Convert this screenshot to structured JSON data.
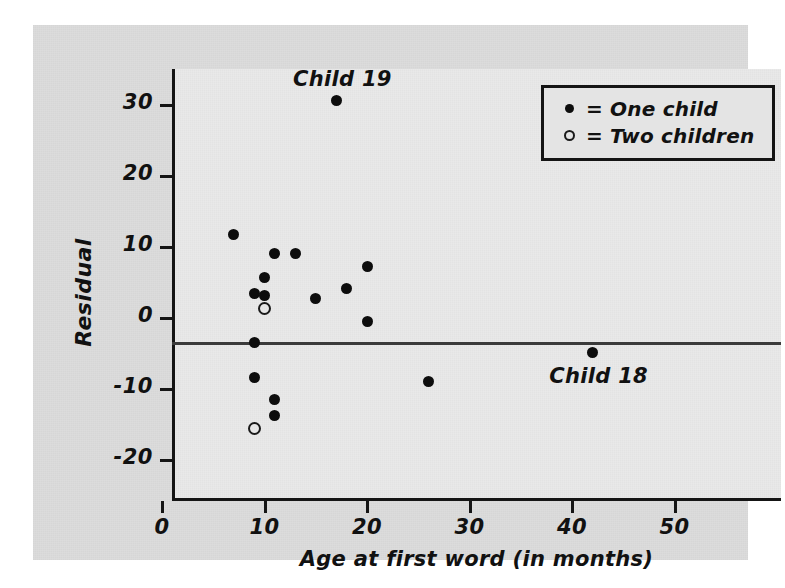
{
  "chart_data": {
    "type": "scatter",
    "title": "",
    "xlabel": "Age at first word (in months)",
    "ylabel": "Residual",
    "xlim": [
      -2,
      57
    ],
    "ylim": [
      -23,
      37
    ],
    "xticks": [
      0,
      10,
      20,
      30,
      40,
      50
    ],
    "yticks": [
      30,
      20,
      10,
      0,
      -10,
      -20
    ],
    "xtick_labels": [
      "0",
      "10",
      "20",
      "30",
      "40",
      "50"
    ],
    "ytick_labels": [
      "30",
      "20",
      "10",
      "0",
      "-10",
      "-20"
    ],
    "grid": false,
    "reference_lines": [
      {
        "axis": "y",
        "value": 0
      }
    ],
    "legend_position": "top-right",
    "series": [
      {
        "name": "One child",
        "marker": "filled-circle",
        "color": "#0d0d0d",
        "points": [
          {
            "x": 7,
            "y": 11.8
          },
          {
            "x": 9,
            "y": 3.5
          },
          {
            "x": 10,
            "y": 5.7
          },
          {
            "x": 10,
            "y": 3.2
          },
          {
            "x": 11,
            "y": 9.1
          },
          {
            "x": 13,
            "y": 9.1
          },
          {
            "x": 15,
            "y": 2.7
          },
          {
            "x": 17,
            "y": 30.6
          },
          {
            "x": 18,
            "y": 4.1
          },
          {
            "x": 20,
            "y": 7.2
          },
          {
            "x": 20,
            "y": -0.5
          },
          {
            "x": 9,
            "y": -3.4
          },
          {
            "x": 9,
            "y": -8.4
          },
          {
            "x": 11,
            "y": -11.5
          },
          {
            "x": 11,
            "y": -13.7
          },
          {
            "x": 26,
            "y": -8.9
          },
          {
            "x": 42,
            "y": -4.8
          }
        ]
      },
      {
        "name": "Two children",
        "marker": "open-circle",
        "color": "#1a1a1a",
        "points": [
          {
            "x": 10,
            "y": 1.4
          },
          {
            "x": 9,
            "y": -15.5
          }
        ]
      }
    ],
    "annotations": [
      {
        "text": "Child 19",
        "x": 17,
        "y": 30.6,
        "position": "above"
      },
      {
        "text": "Child 18",
        "x": 42,
        "y": -4.8,
        "position": "below"
      }
    ]
  },
  "axes": {
    "y_title": "Residual",
    "x_title": "Age at first word (in months)",
    "y_ticks": [
      {
        "label": "30",
        "value": 30
      },
      {
        "label": "20",
        "value": 20
      },
      {
        "label": "10",
        "value": 10
      },
      {
        "label": "0",
        "value": 0
      },
      {
        "label": "-10",
        "value": -10
      },
      {
        "label": "-20",
        "value": -20
      }
    ],
    "x_ticks": [
      {
        "label": "0",
        "value": 0
      },
      {
        "label": "10",
        "value": 10
      },
      {
        "label": "20",
        "value": 20
      },
      {
        "label": "30",
        "value": 30
      },
      {
        "label": "40",
        "value": 40
      },
      {
        "label": "50",
        "value": 50
      }
    ]
  },
  "legend": {
    "rows": [
      {
        "marker": "filled-circle",
        "label": "= One child"
      },
      {
        "marker": "open-circle",
        "label": "= Two children"
      }
    ]
  }
}
